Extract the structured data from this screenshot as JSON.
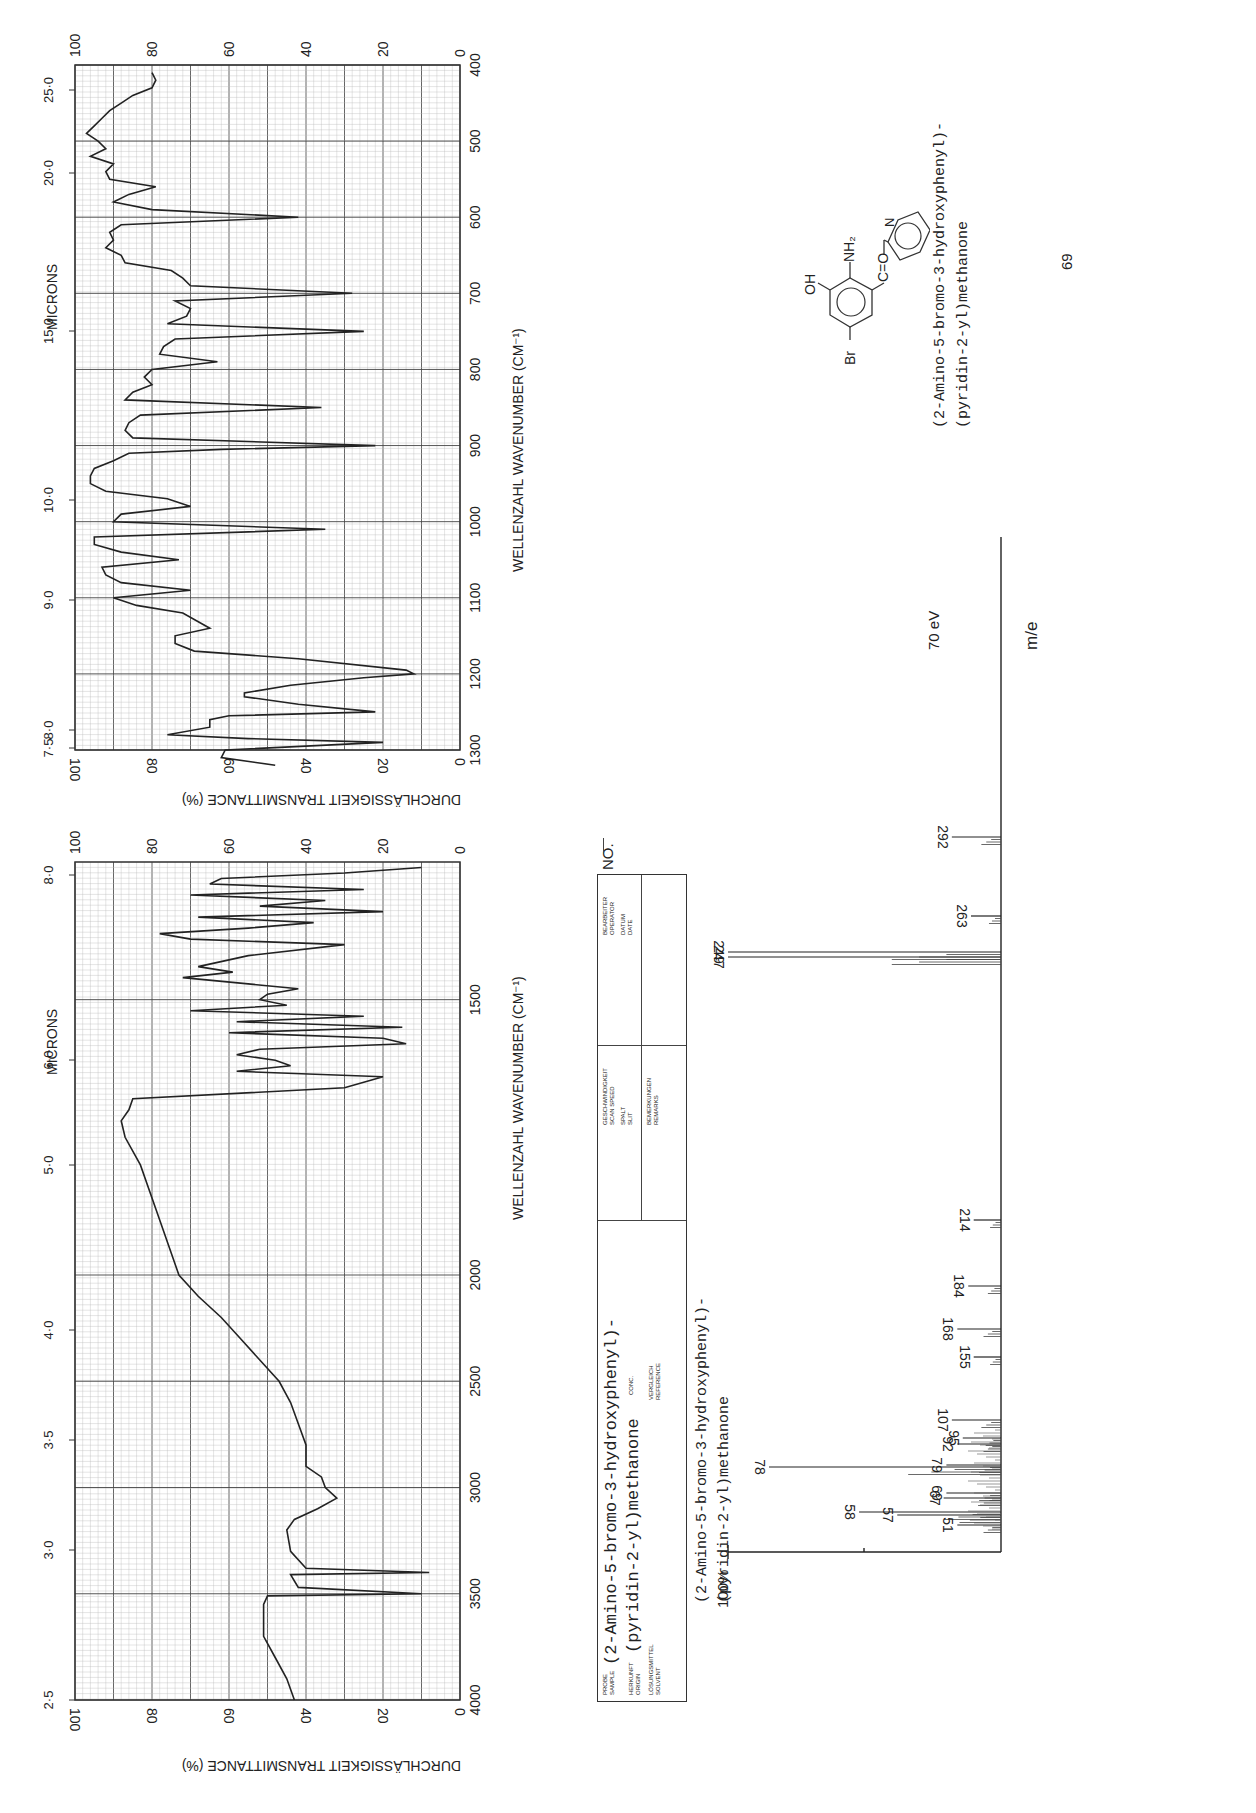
{
  "ir_upper": {
    "microns_label": "MICRONS",
    "wavenumber_label": "WELLENZAHL  WAVENUMBER (CM⁻¹)",
    "transmittance_label": "DURCHLÄSSIGKEIT  TRANSMITTANCE (%)",
    "micron_ticks": [
      "25·0",
      "20·0",
      "15·0",
      "10·0",
      "9·0",
      "8·0",
      "7·5"
    ],
    "wavenumber_ticks": [
      "400",
      "500",
      "600",
      "700",
      "800",
      "900",
      "1000",
      "1100",
      "1200",
      "1300"
    ],
    "transmittance_ticks": [
      "100",
      "80",
      "60",
      "40",
      "20",
      "0"
    ]
  },
  "ir_lower": {
    "microns_label": "MICRONS",
    "wavenumber_label": "WELLENZAHL  WAVENUMBER (CM⁻¹)",
    "transmittance_label": "DURCHLÄSSIGKEIT  TRANSMITTANCE (%)",
    "micron_ticks": [
      "8·0",
      "6·0",
      "5·0",
      "4·0",
      "3·5",
      "3·0",
      "2·5"
    ],
    "wavenumber_ticks": [
      "1500",
      "2000",
      "2500",
      "3000",
      "3500",
      "4000"
    ],
    "transmittance_ticks": [
      "100",
      "80",
      "60",
      "40",
      "20",
      "0"
    ]
  },
  "info_box": {
    "number_label": "NO.",
    "sample_label": "PROBE\nSAMPLE",
    "origin_label": "HERKUNFT\nORIGIN",
    "solvent_label": "LÖSUNGSMITTEL\nSOLVENT",
    "conc_label": "CONC.",
    "reference_label": "VERGLEICH\nREFERENCE",
    "scan_speed_label": "GESCHWINDIGKEIT\nSCAN SPEED",
    "slit_label": "SPALT\nSLIT",
    "remarks_label": "BEMERKUNGEN\nREMARKS",
    "operator_label": "BEARBEITER\nOPERATOR",
    "date_label": "DATUM\nDATE",
    "sample_line1": "(2-Amino-5-bromo-3-hydroxyphenyl)-",
    "sample_line2": "(pyridin-2-yl)methanone"
  },
  "structure": {
    "labels": {
      "oh": "OH",
      "nh2": "NH₂",
      "co": "C=O",
      "br": "Br",
      "n": "N"
    },
    "name_line1": "(2-Amino-5-bromo-3-hydroxyphenyl)-",
    "name_line2": "(pyridin-2-yl)methanone",
    "compound_number": "69"
  },
  "mass_spec": {
    "title_line1": "(2-Amino-5-bromo-3-hydroxyphenyl)-",
    "title_line2": "(pyridin-2-yl)methanone",
    "energy": "70 eV",
    "x_axis_label": "m/e",
    "y_axis_label": "100%"
  },
  "chart_data": [
    {
      "type": "line",
      "title": "IR spectrum 1300–400 cm⁻¹",
      "xlabel": "WELLENZAHL WAVENUMBER (CM⁻¹)",
      "ylabel": "DURCHLÄSSIGKEIT TRANSMITTANCE (%)",
      "xlim": [
        1300,
        400
      ],
      "ylim": [
        0,
        100
      ],
      "grid": true,
      "x": [
        1320,
        1310,
        1300,
        1290,
        1285,
        1280,
        1270,
        1260,
        1255,
        1250,
        1240,
        1230,
        1225,
        1215,
        1205,
        1200,
        1195,
        1180,
        1170,
        1160,
        1150,
        1140,
        1120,
        1110,
        1100,
        1090,
        1080,
        1070,
        1060,
        1050,
        1040,
        1030,
        1020,
        1010,
        1000,
        990,
        980,
        970,
        960,
        950,
        940,
        930,
        920,
        910,
        905,
        900,
        890,
        880,
        870,
        860,
        850,
        840,
        830,
        820,
        810,
        800,
        790,
        780,
        770,
        760,
        750,
        740,
        730,
        720,
        710,
        700,
        690,
        680,
        670,
        660,
        650,
        640,
        630,
        620,
        610,
        600,
        590,
        580,
        570,
        560,
        550,
        540,
        530,
        520,
        510,
        500,
        490,
        480,
        470,
        460,
        450,
        440,
        430,
        420,
        410
      ],
      "y": [
        48,
        62,
        61,
        20,
        55,
        76,
        65,
        65,
        60,
        22,
        42,
        56,
        56,
        44,
        25,
        12,
        14,
        42,
        69,
        74,
        74,
        65,
        72,
        84,
        90,
        70,
        88,
        92,
        93,
        73,
        88,
        95,
        95,
        35,
        90,
        88,
        70,
        76,
        92,
        96,
        96,
        95,
        90,
        86,
        62,
        22,
        85,
        87,
        86,
        83,
        36,
        87,
        85,
        80,
        82,
        80,
        63,
        78,
        77,
        74,
        25,
        76,
        71,
        70,
        74,
        28,
        70,
        72,
        75,
        87,
        88,
        92,
        90,
        91,
        88,
        42,
        80,
        90,
        86,
        79,
        91,
        92,
        90,
        96,
        92,
        94,
        97,
        95,
        93,
        91,
        88,
        85,
        80,
        79,
        80
      ]
    },
    {
      "type": "line",
      "title": "IR spectrum 4000–1300 cm⁻¹",
      "xlabel": "WELLENZAHL WAVENUMBER (CM⁻¹)",
      "ylabel": "DURCHLÄSSIGKEIT TRANSMITTANCE (%)",
      "xlim": [
        4000,
        1250
      ],
      "ylim": [
        0,
        100
      ],
      "grid": true,
      "x": [
        4000,
        3900,
        3800,
        3700,
        3600,
        3550,
        3510,
        3500,
        3470,
        3440,
        3410,
        3400,
        3380,
        3300,
        3200,
        3150,
        3100,
        3050,
        3000,
        2950,
        2900,
        2800,
        2700,
        2600,
        2500,
        2400,
        2300,
        2200,
        2100,
        2000,
        1900,
        1800,
        1750,
        1720,
        1700,
        1680,
        1660,
        1640,
        1630,
        1620,
        1610,
        1600,
        1590,
        1580,
        1570,
        1560,
        1550,
        1540,
        1530,
        1520,
        1510,
        1500,
        1490,
        1480,
        1460,
        1450,
        1440,
        1420,
        1400,
        1390,
        1380,
        1370,
        1360,
        1350,
        1340,
        1330,
        1320,
        1310,
        1300,
        1290,
        1280,
        1270,
        1260
      ],
      "y": [
        43,
        45,
        48,
        51,
        51,
        51,
        50,
        10,
        42,
        43,
        44,
        8,
        40,
        44,
        45,
        43,
        37,
        32,
        35,
        36,
        40,
        40,
        42,
        44,
        47,
        52,
        57,
        62,
        68,
        73,
        78,
        83,
        87,
        88,
        86,
        85,
        30,
        20,
        58,
        44,
        48,
        58,
        52,
        14,
        20,
        60,
        15,
        58,
        25,
        70,
        45,
        52,
        50,
        42,
        72,
        59,
        68,
        55,
        30,
        70,
        78,
        55,
        38,
        68,
        20,
        52,
        35,
        70,
        25,
        65,
        62,
        30,
        10
      ]
    },
    {
      "type": "bar",
      "title": "Mass spectrum (70 eV)",
      "xlabel": "m/e",
      "ylabel": "Relative intensity (%)",
      "ylim": [
        0,
        100
      ],
      "categories": [
        51,
        57,
        58,
        67,
        69,
        78,
        79,
        92,
        95,
        107,
        155,
        168,
        184,
        214,
        247,
        249,
        263,
        292
      ],
      "values": [
        16,
        38,
        52,
        21,
        20,
        85,
        20,
        16,
        14,
        18,
        10,
        16,
        12,
        10,
        100,
        100,
        11,
        18
      ]
    }
  ]
}
